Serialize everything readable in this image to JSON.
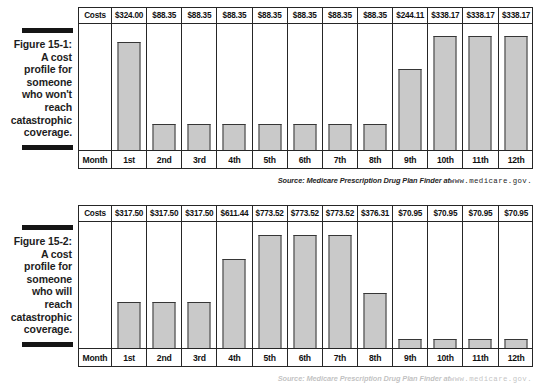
{
  "page": {
    "background": "#ffffff",
    "bar_fill": "#c9c9c9",
    "bar_stroke": "#363636",
    "rule_color": "#151515",
    "text_color": "#1a1a1a"
  },
  "figures": [
    {
      "id": "figure-15-1",
      "label": "Figure 15-1:",
      "caption_lines": [
        "A cost",
        "profile for",
        "someone",
        "who won't",
        "reach",
        "catastrophic",
        "coverage."
      ],
      "row_header_costs": "Costs",
      "row_header_month": "Month",
      "source_prefix": "Source: Medicare Prescription Drug Plan Finder at",
      "source_url": "www.medicare.gov."
    },
    {
      "id": "figure-15-2",
      "label": "Figure 15-2:",
      "caption_lines": [
        "A cost",
        "profile for",
        "someone",
        "who will",
        "reach",
        "catastrophic",
        "coverage."
      ],
      "row_header_costs": "Costs",
      "row_header_month": "Month",
      "source_prefix": "Source: Medicare Prescription Drug Plan Finder at",
      "source_url": "www.medicare.gov."
    }
  ],
  "chart_data": [
    {
      "type": "bar",
      "title": "Figure 15-1: A cost profile for someone who won't reach catastrophic coverage.",
      "xlabel": "Month",
      "ylabel": "Costs",
      "grid": false,
      "legend": "none",
      "ylim": [
        0,
        360
      ],
      "categories": [
        "1st",
        "2nd",
        "3rd",
        "4th",
        "5th",
        "6th",
        "7th",
        "8th",
        "9th",
        "10th",
        "11th",
        "12th"
      ],
      "values": [
        324.0,
        88.35,
        88.35,
        88.35,
        88.35,
        88.35,
        88.35,
        88.35,
        244.11,
        338.17,
        338.17,
        338.17
      ],
      "value_labels": [
        "$324.00",
        "$88.35",
        "$88.35",
        "$88.35",
        "$88.35",
        "$88.35",
        "$88.35",
        "$88.35",
        "$244.11",
        "$338.17",
        "$338.17",
        "$338.17"
      ],
      "bar_heights_px": [
        108,
        26,
        26,
        26,
        26,
        26,
        26,
        26,
        81,
        114,
        114,
        114
      ]
    },
    {
      "type": "bar",
      "title": "Figure 15-2: A cost profile for someone who will reach catastrophic coverage.",
      "xlabel": "Month",
      "ylabel": "Costs",
      "grid": false,
      "legend": "none",
      "ylim": [
        0,
        820
      ],
      "categories": [
        "1st",
        "2nd",
        "3rd",
        "4th",
        "5th",
        "6th",
        "7th",
        "8th",
        "9th",
        "10th",
        "11th",
        "12th"
      ],
      "values": [
        317.5,
        317.5,
        317.5,
        611.44,
        773.52,
        773.52,
        773.52,
        376.31,
        70.95,
        70.95,
        70.95,
        70.95
      ],
      "value_labels": [
        "$317.50",
        "$317.50",
        "$317.50",
        "$611.44",
        "$773.52",
        "$773.52",
        "$773.52",
        "$376.31",
        "$70.95",
        "$70.95",
        "$70.95",
        "$70.95"
      ],
      "bar_heights_px": [
        46,
        46,
        46,
        89,
        113,
        113,
        113,
        55,
        9,
        9,
        9,
        9
      ]
    }
  ]
}
